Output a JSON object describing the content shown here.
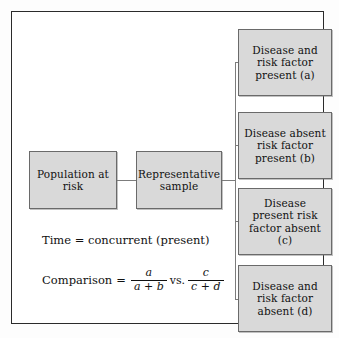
{
  "figure": {
    "type": "flow-diagram",
    "title": "",
    "left_nodes": [
      {
        "id": "population",
        "label": "Population at risk"
      },
      {
        "id": "sample",
        "label": "Representative sample"
      }
    ],
    "outcome_nodes": [
      {
        "id": "a",
        "label": "Disease and risk factor present (a)",
        "cell": "a"
      },
      {
        "id": "b",
        "label": "Disease absent risk factor present (b)",
        "cell": "b"
      },
      {
        "id": "c",
        "label": "Disease present risk factor absent (c)",
        "cell": "c"
      },
      {
        "id": "d",
        "label": "Disease and risk factor absent (d)",
        "cell": "d"
      }
    ],
    "notes": {
      "time": "Time = concurrent (present)",
      "comparison_label": "Comparison",
      "comparison_equals": "=",
      "fraction1_numerator": "a",
      "fraction1_denominator": "a + b",
      "versus": "vs.",
      "fraction2_numerator": "c",
      "fraction2_denominator": "c + d"
    },
    "colors": {
      "box_fill": "#d9d9d9",
      "box_border": "#6a6a6a",
      "frame_border": "#2b2b2b",
      "connector": "#7c7c7c",
      "text": "#111111",
      "background": "#ffffff"
    }
  }
}
